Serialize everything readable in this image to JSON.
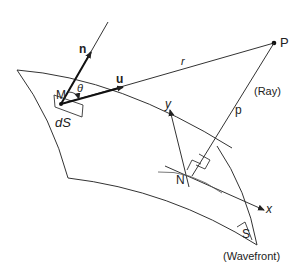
{
  "diagram": {
    "type": "wavefront-ray-geometry",
    "labels": {
      "normal_vector": "n",
      "direction_vector": "u",
      "point_M": "M",
      "angle": "θ",
      "surface_element": "dS",
      "distance_r": "r",
      "point_P": "P",
      "ray_label": "(Ray)",
      "distance_p": "p",
      "axis_y": "y",
      "axis_x": "x",
      "point_N": "N",
      "area_S": "S",
      "wavefront_label": "(Wavefront)"
    },
    "colors": {
      "stroke": "#333333",
      "background": "#ffffff"
    }
  }
}
